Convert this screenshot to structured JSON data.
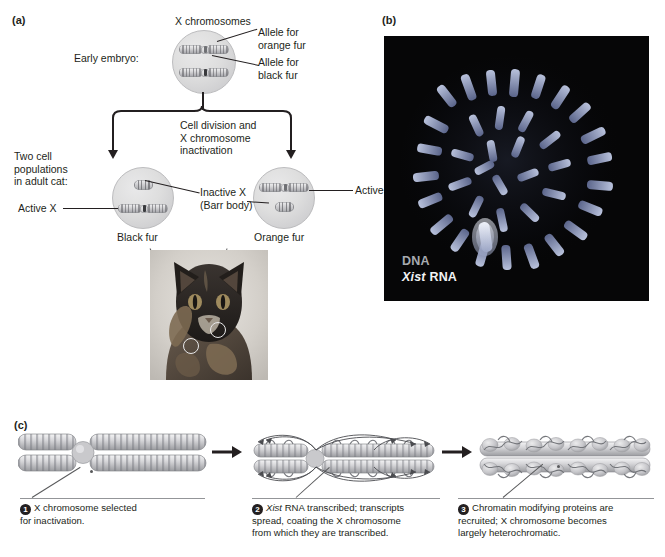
{
  "figure": {
    "panels": [
      {
        "id": "a",
        "letter": "(a)"
      },
      {
        "id": "b",
        "letter": "(b)"
      },
      {
        "id": "c",
        "letter": "(c)"
      }
    ]
  },
  "panel_a": {
    "letter": "(a)",
    "title_x_chromosomes": "X chromosomes",
    "early_embryo_label": "Early embryo:",
    "allele_orange_line1": "Allele for",
    "allele_orange_line2": "orange fur",
    "allele_black_line1": "Allele for",
    "allele_black_line2": "black fur",
    "process_line1": "Cell division and",
    "process_line2": "X chromosome",
    "process_line3": "inactivation",
    "two_cell_line1": "Two cell",
    "two_cell_line2": "populations",
    "two_cell_line3": "in adult cat:",
    "active_x_left": "Active X",
    "inactive_x_line1": "Inactive X",
    "inactive_x_line2": "(Barr body)",
    "active_x_right": "Active X",
    "black_fur": "Black fur",
    "orange_fur": "Orange fur",
    "photo_black_fur_callout": "Black fur",
    "photo_orange_fur_callout": "Orange fur"
  },
  "panel_b": {
    "letter": "(b)",
    "label_dna": "DNA",
    "label_xist_italic": "Xist",
    "label_xist_rest": " RNA"
  },
  "panel_c": {
    "letter": "(c)",
    "steps": [
      {
        "number": "1",
        "text_line1": "X chromosome selected",
        "text_line2": "for inactivation."
      },
      {
        "number": "2",
        "italic_lead": "Xist",
        "text_line1": " RNA transcribed; transcripts",
        "text_line2": "spread, coating the X chromosome",
        "text_line3": "from which they are transcribed."
      },
      {
        "number": "3",
        "text_line1": "Chromatin modifying proteins are",
        "text_line2": "recruited; X chromosome becomes",
        "text_line3": "largely heterochromatic."
      }
    ]
  },
  "colors": {
    "text": "#231f20",
    "leader": "#231f20",
    "rule": "#939598",
    "micrograph_background": "#060607",
    "dna_label": "#a7aab0",
    "xist_label": "#f2f3f5"
  }
}
